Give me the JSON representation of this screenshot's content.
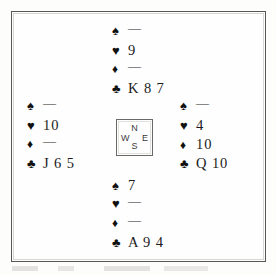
{
  "diagram": {
    "kind": "bridge-hand-diagram",
    "void_mark": "—",
    "ink_color": "#1b1b1b",
    "frame_color": "#585755",
    "paper_color": "#fefefe"
  },
  "compass": {
    "north": "N",
    "west": "W",
    "east": "E",
    "south": "S"
  },
  "suits": {
    "spade": "♠",
    "heart": "♥",
    "diamond": "♦",
    "club": "♣"
  },
  "hands": {
    "north": {
      "position": "North",
      "spades": "—",
      "hearts": "9",
      "diamonds": "—",
      "clubs": "K 8 7"
    },
    "west": {
      "position": "West",
      "spades": "—",
      "hearts": "10",
      "diamonds": "—",
      "clubs": "J 6 5"
    },
    "east": {
      "position": "East",
      "spades": "—",
      "hearts": "4",
      "diamonds": "10",
      "clubs": "Q 10"
    },
    "south": {
      "position": "South",
      "spades": "7",
      "hearts": "—",
      "diamonds": "—",
      "clubs": "A 9 4"
    }
  }
}
